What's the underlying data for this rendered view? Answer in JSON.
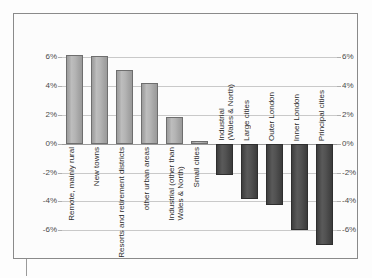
{
  "chart_data": {
    "type": "bar",
    "title": "",
    "subtitle": "",
    "xlabel": "",
    "ylabel": "",
    "ylim": [
      -8,
      7
    ],
    "grid": true,
    "legend": "none",
    "y_tick_labels_left": [
      "6%",
      "4%",
      "2%",
      "0%",
      "-2%",
      "-4%",
      "-6%"
    ],
    "y_tick_labels_right": [
      "6%",
      "4%",
      "2%",
      "0%",
      "-2%",
      "-4%",
      "-6%"
    ],
    "y_ticks": [
      6,
      4,
      2,
      0,
      -2,
      -4,
      -6
    ],
    "categories": [
      "Remote, mainly rural",
      "New towns",
      "Resorts and retirement districts",
      "other urban areas",
      "Industrial (other than\nWales & North)",
      "Small cities",
      "Industrial\n(Wales & North)",
      "Large cities",
      "Outer London",
      "Inner London",
      "Principal cities"
    ],
    "values": [
      6.2,
      6.1,
      5.1,
      4.2,
      1.85,
      0.2,
      -2.2,
      -3.8,
      -4.25,
      -6.0,
      -7.0
    ],
    "value_labels": [
      "6.2%",
      "6.1%",
      "5.1%",
      "4.2%",
      "1.9%",
      "0.2%",
      "-2.2%",
      "-3.8%",
      "-4.3%",
      "-6.0%",
      "-7.0%"
    ],
    "colors": {
      "positive_bar": "#b0b0b0",
      "positive_bar_border": "#6e6e6e",
      "negative_bar": "#4d4d4d",
      "negative_bar_border": "#2e2e2e",
      "gridline": "#c9c9c9",
      "zero_line": "#9a9a9a",
      "frame_border": "#8a8a8a",
      "plot_background": "#fcfcfc",
      "tick_text": "#4a4a4a",
      "category_text": "#2d2d2d"
    }
  }
}
